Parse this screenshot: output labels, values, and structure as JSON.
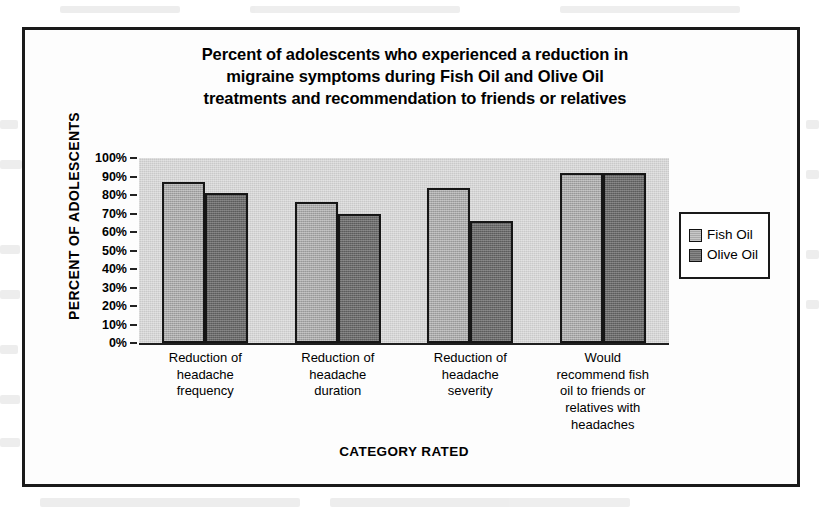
{
  "chart_data": {
    "type": "bar",
    "title": "Percent of adolescents who experienced a reduction in migraine symptoms during Fish Oil and Olive Oil treatments and recommendation to friends or relatives",
    "title_lines": [
      "Percent of adolescents who experienced a reduction in",
      "migraine symptoms during Fish Oil and Olive Oil",
      "treatments and recommendation to friends or relatives"
    ],
    "xlabel": "CATEGORY RATED",
    "ylabel": "PERCENT OF ADOLESCENTS",
    "ylim": [
      0,
      100
    ],
    "ytick_labels": [
      "100%",
      "90%",
      "80%",
      "70%",
      "60%",
      "50%",
      "40%",
      "30%",
      "20%",
      "10%",
      "0%"
    ],
    "ytick_values": [
      100,
      90,
      80,
      70,
      60,
      50,
      40,
      30,
      20,
      10,
      0
    ],
    "grid": false,
    "legend_position": "right",
    "categories": [
      "Reduction of headache frequency",
      "Reduction of headache duration",
      "Reduction of headache severity",
      "Would recommend fish oil to friends or relatives with headaches"
    ],
    "category_lines": [
      [
        "Reduction of",
        "headache",
        "frequency"
      ],
      [
        "Reduction of",
        "headache",
        "duration"
      ],
      [
        "Reduction of",
        "headache",
        "severity"
      ],
      [
        "Would",
        "recommend fish",
        "oil to friends or",
        "relatives with",
        "headaches"
      ]
    ],
    "series": [
      {
        "name": "Fish Oil",
        "color": "#a9a9a9",
        "values": [
          87,
          76,
          84,
          92
        ]
      },
      {
        "name": "Olive Oil",
        "color": "#6b6b6b",
        "values": [
          81,
          70,
          66,
          92
        ]
      }
    ]
  },
  "legend": {
    "items": [
      {
        "label": "Fish Oil"
      },
      {
        "label": "Olive Oil"
      }
    ]
  }
}
